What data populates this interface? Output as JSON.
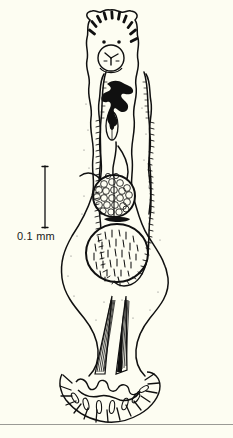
{
  "figure": {
    "kind": "scientific-line-drawing",
    "background_color": "#fdfdf2",
    "ink_color": "#101010",
    "width": 233,
    "height": 438
  },
  "scale_bar": {
    "label": "0.1 mm",
    "orientation": "vertical",
    "x": 45,
    "y_top": 166,
    "y_bottom": 228,
    "cap_half_width": 3,
    "line_color": "#101010",
    "label_color": "#1a1a1a"
  },
  "anatomy": {
    "head_crown": {
      "name": "anterior spine crown",
      "spine_count": 10,
      "fill": "#101010"
    },
    "eyespots": {
      "name": "eyespots",
      "count": 2,
      "fill": "#101010"
    },
    "oral_sucker": {
      "name": "oral sucker",
      "cx": 110,
      "cy": 57,
      "r": 13
    },
    "dark_organ": {
      "name": "pharynx and cirrus complex",
      "fill": "#101010"
    },
    "small_oval_organ": {
      "name": "ovary",
      "cx": 112,
      "cy": 126,
      "rx": 6,
      "ry": 14
    },
    "granular_sphere": {
      "name": "vitellarium egg mass",
      "cx": 114,
      "cy": 196,
      "r": 21,
      "cell_count": 44
    },
    "stippled_ovoid": {
      "name": "ventral sucker body",
      "cx": 118,
      "cy": 254,
      "rx": 30,
      "ry": 29,
      "dash_count": 80
    },
    "muscle_bundles": {
      "name": "posterior muscle bundles",
      "count": 2
    },
    "attachment_disc": {
      "name": "posterior attachment disc",
      "marginal_hook_count": 16
    }
  },
  "footer": {
    "rule_color": "#9a9a95",
    "rule_y": 424
  }
}
